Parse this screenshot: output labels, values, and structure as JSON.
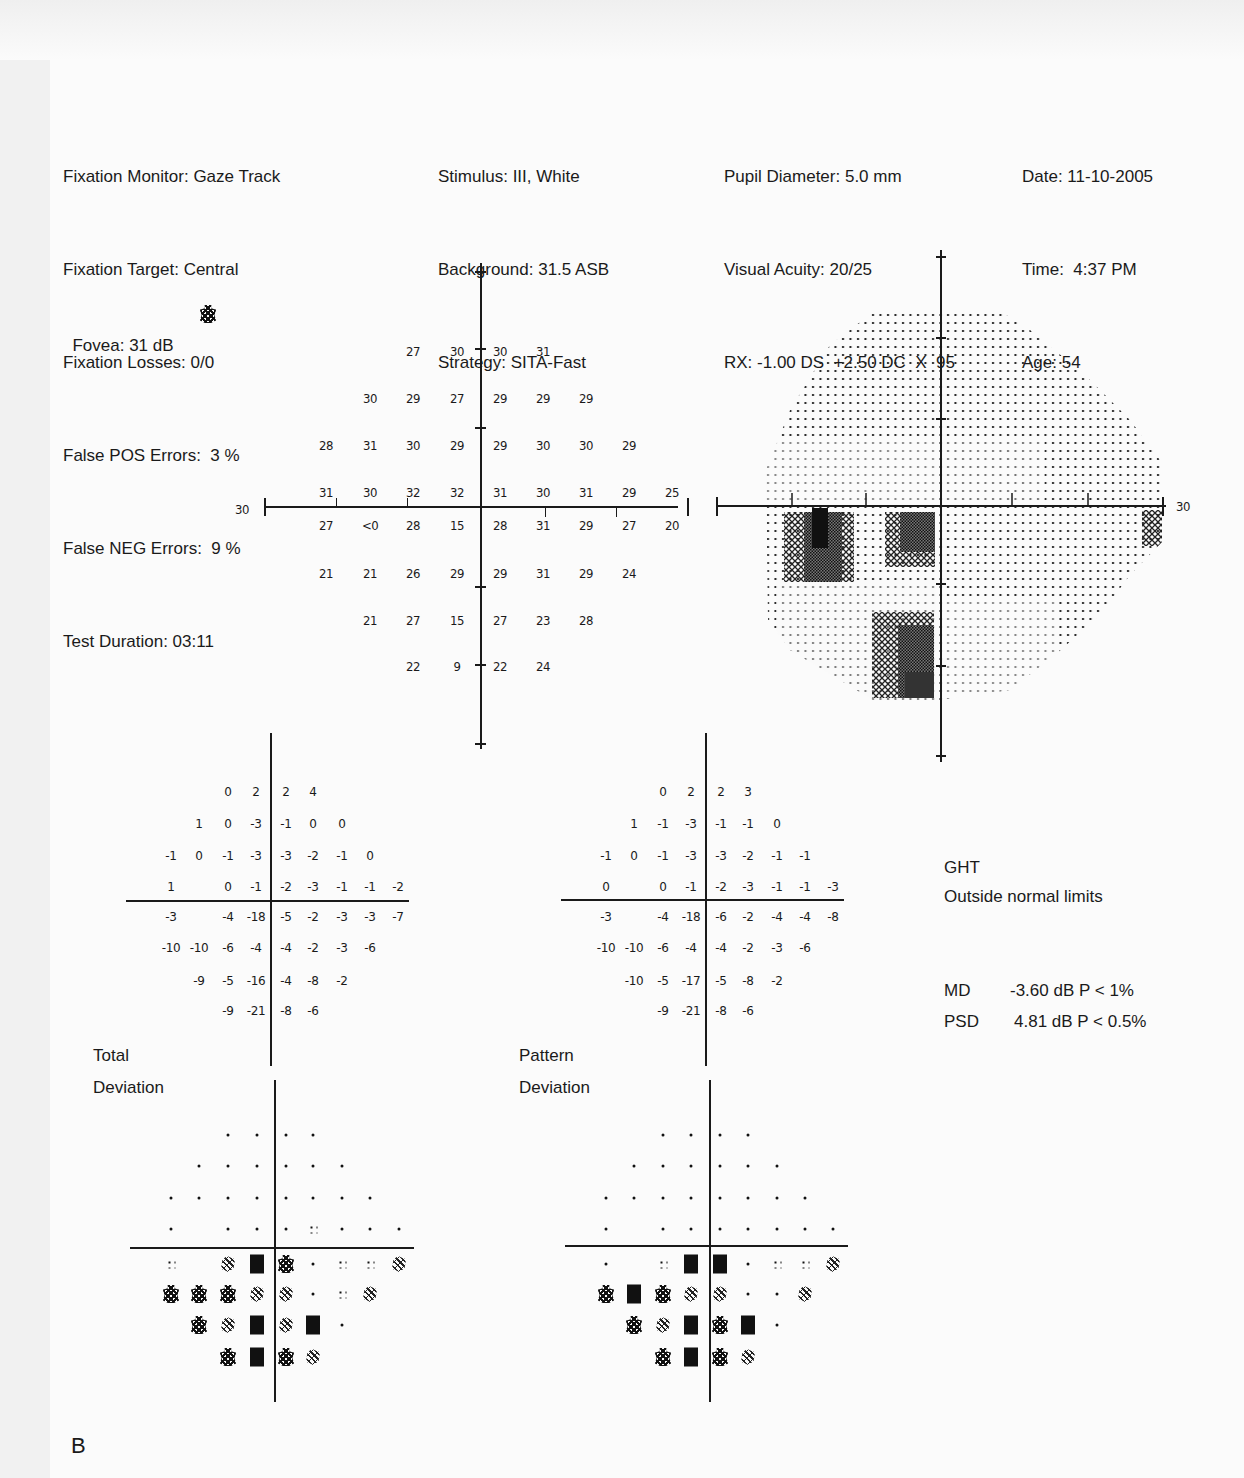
{
  "header": {
    "col1": [
      "Fixation Monitor: Gaze Track",
      "Fixation Target: Central",
      "Fixation Losses: 0/0",
      "False POS Errors:  3 %",
      "False NEG Errors:  9 %",
      "Test Duration: 03:11"
    ],
    "fovea": "Fovea: 31 dB",
    "col2": [
      "Stimulus: III, White",
      "Background: 31.5 ASB",
      "Strategy: SITA-Fast"
    ],
    "col3": [
      "Pupil Diameter: 5.0 mm",
      "Visual Acuity: 20/25",
      "RX: -1.00 DS  +2.50 DC  X  95"
    ],
    "col4": [
      "Date: 11-10-2005",
      "Time:  4:37 PM",
      "Age: 54"
    ]
  },
  "threshold_plot": {
    "axis_label_left": "30",
    "axis_label_right": "30",
    "rows": [
      [
        "",
        "",
        "27",
        "30",
        "30",
        "31",
        "",
        "",
        ""
      ],
      [
        "",
        "30",
        "29",
        "27",
        "29",
        "29",
        "29",
        "",
        ""
      ],
      [
        "28",
        "31",
        "30",
        "29",
        "29",
        "30",
        "30",
        "29",
        ""
      ],
      [
        "31",
        "30",
        "32",
        "32",
        "31",
        "30",
        "31",
        "29",
        "25"
      ],
      [
        "27",
        "<0",
        "28",
        "15",
        "28",
        "31",
        "29",
        "27",
        "20"
      ],
      [
        "21",
        "21",
        "26",
        "29",
        "29",
        "31",
        "29",
        "24",
        ""
      ],
      [
        "",
        "21",
        "27",
        "15",
        "27",
        "23",
        "28",
        "",
        ""
      ],
      [
        "",
        "",
        "22",
        "9",
        "22",
        "24",
        "",
        "",
        ""
      ]
    ]
  },
  "total_deviation": {
    "label_line1": "Total",
    "label_line2": "Deviation",
    "rows": [
      [
        "",
        "",
        "0",
        "2",
        "2",
        "4",
        "",
        "",
        ""
      ],
      [
        "",
        "1",
        "0",
        "-3",
        "-1",
        "0",
        "0",
        "",
        ""
      ],
      [
        "-1",
        "0",
        "-1",
        "-3",
        "-3",
        "-2",
        "-1",
        "0",
        ""
      ],
      [
        "1",
        "",
        "0",
        "-1",
        "-2",
        "-3",
        "-1",
        "-1",
        "-2"
      ],
      [
        "-3",
        "",
        "-4",
        "-18",
        "-5",
        "-2",
        "-3",
        "-3",
        "-7"
      ],
      [
        "-10",
        "-10",
        "-6",
        "-4",
        "-4",
        "-2",
        "-3",
        "-6",
        ""
      ],
      [
        "",
        "-9",
        "-5",
        "-16",
        "-4",
        "-8",
        "-2",
        "",
        ""
      ],
      [
        "",
        "",
        "-9",
        "-21",
        "-8",
        "-6",
        "",
        "",
        ""
      ]
    ],
    "prob_rows": [
      [
        "",
        "",
        "dot",
        "dot",
        "dot",
        "dot",
        "",
        "",
        ""
      ],
      [
        "",
        "dot",
        "dot",
        "dot",
        "dot",
        "dot",
        "dot",
        "",
        ""
      ],
      [
        "dot",
        "dot",
        "dot",
        "dot",
        "dot",
        "dot",
        "dot",
        "dot",
        ""
      ],
      [
        "dot",
        "",
        "dot",
        "dot",
        "dot",
        "p5",
        "dot",
        "dot",
        "dot"
      ],
      [
        "p5",
        "",
        "p2",
        "p05",
        "p1",
        "dot",
        "p5",
        "p5",
        "p2"
      ],
      [
        "p1",
        "p1",
        "p1",
        "p2",
        "p2",
        "dot",
        "p5",
        "p2",
        ""
      ],
      [
        "",
        "p1",
        "p2",
        "p05",
        "p2",
        "p05",
        "dot",
        "",
        ""
      ],
      [
        "",
        "",
        "p1",
        "p05",
        "p1",
        "p2",
        "",
        "",
        ""
      ]
    ]
  },
  "pattern_deviation": {
    "label_line1": "Pattern",
    "label_line2": "Deviation",
    "rows": [
      [
        "",
        "",
        "0",
        "2",
        "2",
        "3",
        "",
        "",
        ""
      ],
      [
        "",
        "1",
        "-1",
        "-3",
        "-1",
        "-1",
        "0",
        "",
        ""
      ],
      [
        "-1",
        "0",
        "-1",
        "-3",
        "-3",
        "-2",
        "-1",
        "-1",
        ""
      ],
      [
        "0",
        "",
        "0",
        "-1",
        "-2",
        "-3",
        "-1",
        "-1",
        "-3"
      ],
      [
        "-3",
        "",
        "-4",
        "-18",
        "-6",
        "-2",
        "-4",
        "-4",
        "-8"
      ],
      [
        "-10",
        "-10",
        "-6",
        "-4",
        "-4",
        "-2",
        "-3",
        "-6",
        ""
      ],
      [
        "",
        "-10",
        "-5",
        "-17",
        "-5",
        "-8",
        "-2",
        "",
        ""
      ],
      [
        "",
        "",
        "-9",
        "-21",
        "-8",
        "-6",
        "",
        "",
        ""
      ]
    ],
    "prob_rows": [
      [
        "",
        "",
        "dot",
        "dot",
        "dot",
        "dot",
        "",
        "",
        ""
      ],
      [
        "",
        "dot",
        "dot",
        "dot",
        "dot",
        "dot",
        "dot",
        "",
        ""
      ],
      [
        "dot",
        "dot",
        "dot",
        "dot",
        "dot",
        "dot",
        "dot",
        "dot",
        ""
      ],
      [
        "dot",
        "",
        "dot",
        "dot",
        "dot",
        "dot",
        "dot",
        "dot",
        "dot"
      ],
      [
        "dot",
        "",
        "p5",
        "p05",
        "p05",
        "dot",
        "p5",
        "p5",
        "p2"
      ],
      [
        "p1",
        "p05",
        "p1",
        "p2",
        "p2",
        "dot",
        "dot",
        "p2",
        ""
      ],
      [
        "",
        "p1",
        "p2",
        "p05",
        "p1",
        "p05",
        "dot",
        "",
        ""
      ],
      [
        "",
        "",
        "p1",
        "p05",
        "p1",
        "p2",
        "",
        "",
        ""
      ]
    ]
  },
  "indices": {
    "ght_title": "GHT",
    "ght_result": "Outside normal limits",
    "md_label": "MD",
    "md_value": "-3.60 dB  P < 1%",
    "psd_label": "PSD",
    "psd_value": "4.81 dB  P < 0.5%"
  },
  "figure_label": "B",
  "symbols": {
    "dot": "normal",
    "p5": "P < 5%",
    "p2": "P < 2%",
    "p1": "P < 1%",
    "p05": "P < 0.5%"
  }
}
